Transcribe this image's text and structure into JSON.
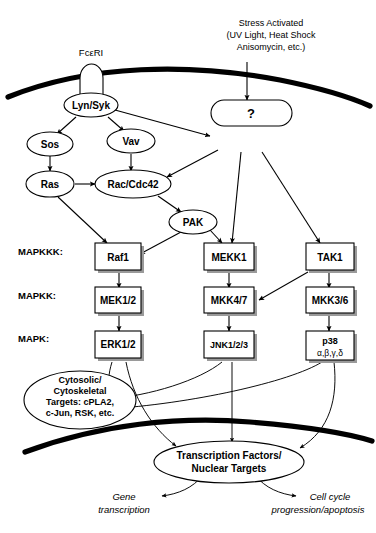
{
  "figure": {
    "stimulus_label_line1": "Stress Activated",
    "stimulus_label_line2": "(UV Light, Heat Shock",
    "stimulus_label_line3": "Anisomycin, etc.)",
    "receptor_label": "FcεRI"
  },
  "row_labels": {
    "mapkkk": "MAPKKK:",
    "mapkk": "MAPKK:",
    "mapk": "MAPK:"
  },
  "nodes": {
    "lyn_syk": "Lyn/Syk",
    "sos": "Sos",
    "vav": "Vav",
    "ras": "Ras",
    "rac_cdc42": "Rac/Cdc42",
    "pak": "PAK",
    "unknown": "?",
    "raf1": "Raf1",
    "mekk1": "MEKK1",
    "tak1": "TAK1",
    "mek12": "MEK1/2",
    "mkk47": "MKK4/7",
    "mkk36": "MKK3/6",
    "erk12": "ERK1/2",
    "jnk123": "JNK1/2/3",
    "p38": "p38",
    "p38_isoforms": "α,β,γ,δ"
  },
  "targets": {
    "cytosolic_line1": "Cytosolic/",
    "cytosolic_line2": "Cytoskeletal",
    "cytosolic_line3": "Targets: cPLA2,",
    "cytosolic_line4": "c-Jun, RSK, etc.",
    "transcription_line1": "Transcription Factors/",
    "transcription_line2": "Nuclear Targets"
  },
  "outcomes": {
    "gene_line1": "Gene",
    "gene_line2": "transcription",
    "cellcycle_line1": "Cell cycle",
    "cellcycle_line2": "progression/apoptosis"
  },
  "colors": {
    "stroke": "#000000",
    "fill": "#ffffff",
    "shadow": "#9a9a9a",
    "background": "#ffffff"
  }
}
